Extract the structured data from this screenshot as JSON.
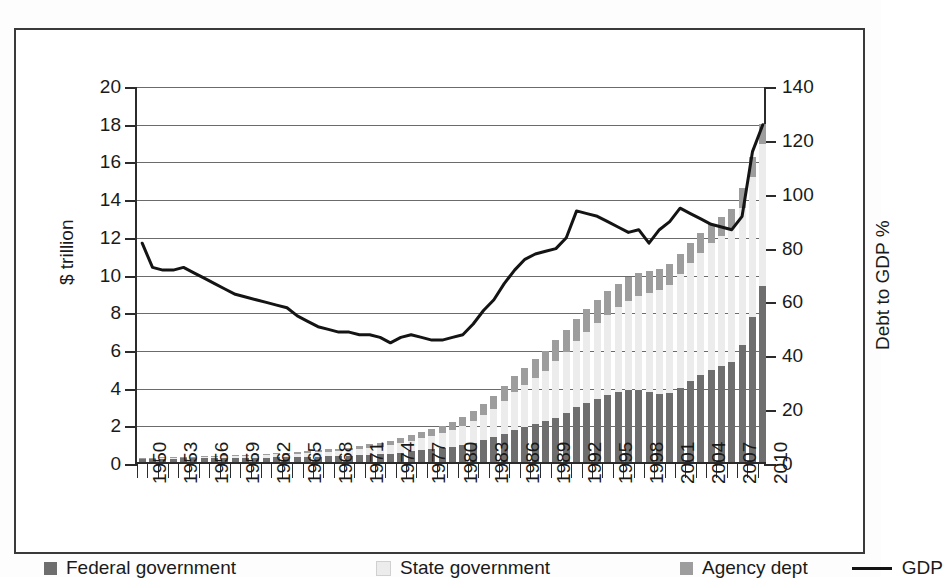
{
  "chart_data": {
    "type": "bar",
    "title": "",
    "xlabel": "",
    "ylabel": "$ trillion",
    "y2label": "Debt to GDP %",
    "grid": true,
    "legend_position": "bottom",
    "ylim": [
      0,
      20
    ],
    "y2lim": [
      0,
      140
    ],
    "yticks": [
      "0",
      "2",
      "4",
      "6",
      "8",
      "10",
      "12",
      "14",
      "16",
      "18",
      "20"
    ],
    "y2ticks": [
      "0",
      "20",
      "40",
      "60",
      "80",
      "100",
      "120",
      "140"
    ],
    "x": [
      1950,
      1951,
      1952,
      1953,
      1954,
      1955,
      1956,
      1957,
      1958,
      1959,
      1960,
      1961,
      1962,
      1963,
      1964,
      1965,
      1966,
      1967,
      1968,
      1969,
      1970,
      1971,
      1972,
      1973,
      1974,
      1975,
      1976,
      1977,
      1978,
      1979,
      1980,
      1981,
      1982,
      1983,
      1984,
      1985,
      1986,
      1987,
      1988,
      1989,
      1990,
      1991,
      1992,
      1993,
      1994,
      1995,
      1996,
      1997,
      1998,
      1999,
      2000,
      2001,
      2002,
      2003,
      2004,
      2005,
      2006,
      2007,
      2008,
      2009,
      2010
    ],
    "xtick_labels": [
      "1950",
      "1953",
      "1956",
      "1959",
      "1962",
      "1965",
      "1968",
      "1971",
      "1974",
      "1977",
      "1980",
      "1983",
      "1986",
      "1989",
      "1992",
      "1995",
      "1998",
      "2001",
      "2004",
      "2007",
      "2010"
    ],
    "xtick_step": 3,
    "series": [
      {
        "name": "Federal government",
        "color": "#6e6e6e",
        "stack": "debt",
        "values": [
          0.16,
          0.16,
          0.17,
          0.18,
          0.19,
          0.19,
          0.19,
          0.19,
          0.2,
          0.21,
          0.21,
          0.22,
          0.23,
          0.24,
          0.25,
          0.26,
          0.27,
          0.28,
          0.3,
          0.31,
          0.32,
          0.35,
          0.38,
          0.4,
          0.42,
          0.49,
          0.56,
          0.62,
          0.68,
          0.73,
          0.8,
          0.9,
          1.02,
          1.17,
          1.32,
          1.5,
          1.7,
          1.86,
          2.0,
          2.15,
          2.35,
          2.6,
          2.9,
          3.15,
          3.35,
          3.55,
          3.7,
          3.8,
          3.8,
          3.7,
          3.6,
          3.65,
          3.95,
          4.3,
          4.6,
          4.9,
          5.1,
          5.3,
          6.2,
          7.7,
          9.35
        ]
      },
      {
        "name": "State government",
        "color": "#ececec",
        "stack": "debt",
        "values": [
          0.03,
          0.04,
          0.04,
          0.05,
          0.06,
          0.07,
          0.08,
          0.09,
          0.1,
          0.11,
          0.12,
          0.13,
          0.14,
          0.16,
          0.17,
          0.19,
          0.21,
          0.23,
          0.25,
          0.27,
          0.3,
          0.34,
          0.38,
          0.42,
          0.46,
          0.52,
          0.58,
          0.64,
          0.72,
          0.8,
          0.9,
          1.0,
          1.15,
          1.3,
          1.5,
          1.75,
          2.0,
          2.2,
          2.45,
          2.7,
          3.0,
          3.25,
          3.5,
          3.75,
          4.0,
          4.25,
          4.5,
          4.75,
          5.0,
          5.25,
          5.5,
          5.75,
          6.0,
          6.25,
          6.5,
          6.7,
          6.9,
          7.1,
          7.3,
          7.4,
          7.5
        ]
      },
      {
        "name": "Agency dept",
        "color": "#9d9d9d",
        "stack": "debt",
        "values": [
          0.02,
          0.02,
          0.02,
          0.03,
          0.03,
          0.03,
          0.04,
          0.04,
          0.05,
          0.05,
          0.06,
          0.06,
          0.07,
          0.07,
          0.08,
          0.09,
          0.1,
          0.11,
          0.12,
          0.13,
          0.15,
          0.17,
          0.19,
          0.21,
          0.23,
          0.26,
          0.29,
          0.32,
          0.36,
          0.4,
          0.45,
          0.5,
          0.55,
          0.62,
          0.7,
          0.78,
          0.85,
          0.92,
          1.0,
          1.05,
          1.1,
          1.15,
          1.2,
          1.22,
          1.24,
          1.25,
          1.25,
          1.25,
          1.22,
          1.18,
          1.15,
          1.12,
          1.1,
          1.08,
          1.05,
          1.02,
          1.0,
          1.0,
          1.05,
          1.08,
          1.1
        ]
      },
      {
        "name": "GDP",
        "color": "#141414",
        "type": "line",
        "axis": "right",
        "unit": "Debt to GDP %",
        "values": [
          82,
          73,
          72,
          72,
          73,
          71,
          69,
          67,
          65,
          63,
          62,
          61,
          60,
          59,
          58,
          55,
          53,
          51,
          50,
          49,
          49,
          48,
          48,
          47,
          45,
          47,
          48,
          47,
          46,
          46,
          47,
          48,
          52,
          57,
          61,
          67,
          72,
          76,
          78,
          79,
          80,
          84,
          94,
          93,
          92,
          90,
          88,
          86,
          87,
          82,
          87,
          90,
          95,
          93,
          91,
          89,
          88,
          87,
          92,
          116,
          126
        ]
      }
    ]
  },
  "legend": {
    "items": [
      {
        "label": "Federal government",
        "marker": "square",
        "color": "#6e6e6e"
      },
      {
        "label": "State government",
        "marker": "square",
        "color": "#ececec"
      },
      {
        "label": "Agency dept",
        "marker": "square",
        "color": "#9d9d9d"
      },
      {
        "label": "GDP",
        "marker": "line",
        "color": "#141414"
      }
    ]
  }
}
